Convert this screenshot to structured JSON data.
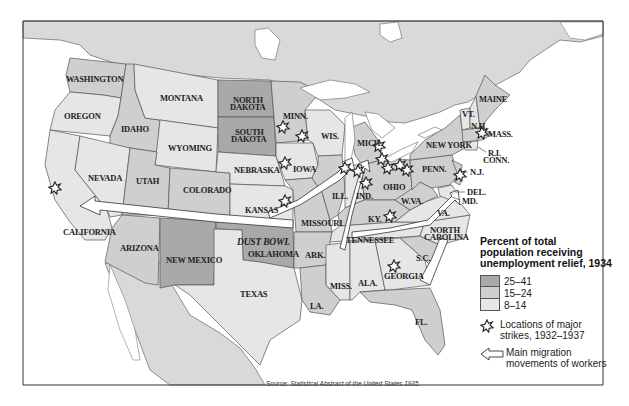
{
  "map": {
    "title": "Percent of total population receiving unemployment relief, 1934",
    "colors": {
      "high": "#a9a9a9",
      "medium": "#cfcfcf",
      "low": "#e6e6e6",
      "canada_mexico": "#d9d9d9",
      "water": "#ffffff",
      "border": "#555555"
    },
    "states": [
      {
        "name": "WASHINGTON",
        "category": "15-24"
      },
      {
        "name": "OREGON",
        "category": "8-14"
      },
      {
        "name": "CALIFORNIA",
        "category": "8-14"
      },
      {
        "name": "IDAHO",
        "category": "15-24"
      },
      {
        "name": "NEVADA",
        "category": "8-14"
      },
      {
        "name": "MONTANA",
        "category": "8-14"
      },
      {
        "name": "WYOMING",
        "category": "8-14"
      },
      {
        "name": "UTAH",
        "category": "15-24"
      },
      {
        "name": "COLORADO",
        "category": "15-24"
      },
      {
        "name": "ARIZONA",
        "category": "15-24"
      },
      {
        "name": "NEW MEXICO",
        "category": "25-41"
      },
      {
        "name": "NORTH DAKOTA",
        "category": "25-41"
      },
      {
        "name": "SOUTH DAKOTA",
        "category": "25-41"
      },
      {
        "name": "NEBRASKA",
        "category": "8-14"
      },
      {
        "name": "KANSAS",
        "category": "8-14"
      },
      {
        "name": "OKLAHOMA",
        "category": "25-41"
      },
      {
        "name": "TEXAS",
        "category": "8-14"
      },
      {
        "name": "MINN.",
        "category": "15-24"
      },
      {
        "name": "IOWA",
        "category": "8-14"
      },
      {
        "name": "MISSOURI",
        "category": "15-24"
      },
      {
        "name": "ARK.",
        "category": "15-24"
      },
      {
        "name": "LA.",
        "category": "15-24"
      },
      {
        "name": "WIS.",
        "category": "8-14"
      },
      {
        "name": "ILL.",
        "category": "15-24"
      },
      {
        "name": "MICH.",
        "category": "15-24"
      },
      {
        "name": "IND.",
        "category": "8-14"
      },
      {
        "name": "OHIO",
        "category": "15-24"
      },
      {
        "name": "KY.",
        "category": "15-24"
      },
      {
        "name": "TENNESSEE",
        "category": "8-14"
      },
      {
        "name": "MISS.",
        "category": "8-14"
      },
      {
        "name": "ALA.",
        "category": "8-14"
      },
      {
        "name": "GEORGIA",
        "category": "8-14"
      },
      {
        "name": "FL.",
        "category": "15-24"
      },
      {
        "name": "S.C.",
        "category": "15-24"
      },
      {
        "name": "NORTH CAROLINA",
        "category": "8-14"
      },
      {
        "name": "VA.",
        "category": "8-14"
      },
      {
        "name": "W.VA.",
        "category": "15-24"
      },
      {
        "name": "PENN.",
        "category": "15-24"
      },
      {
        "name": "NEW YORK",
        "category": "15-24"
      },
      {
        "name": "N.J.",
        "category": "15-24"
      },
      {
        "name": "DEL.",
        "category": "8-14"
      },
      {
        "name": "MD.",
        "category": "8-14"
      },
      {
        "name": "VT.",
        "category": "8-14"
      },
      {
        "name": "N.H.",
        "category": "8-14"
      },
      {
        "name": "MAINE",
        "category": "15-24"
      },
      {
        "name": "MASS.",
        "category": "15-24"
      },
      {
        "name": "R.I.",
        "category": "15-24"
      },
      {
        "name": "CONN.",
        "category": "8-14"
      }
    ],
    "labels": {
      "washington": "WASHINGTON",
      "oregon": "OREGON",
      "california": "CALIFORNIA",
      "idaho": "IDAHO",
      "nevada": "NEVADA",
      "montana": "MONTANA",
      "wyoming": "WYOMING",
      "utah": "UTAH",
      "colorado": "COLORADO",
      "arizona": "ARIZONA",
      "new_mexico": "NEW MEXICO",
      "north_dakota_1": "NORTH",
      "north_dakota_2": "DAKOTA",
      "south_dakota_1": "SOUTH",
      "south_dakota_2": "DAKOTA",
      "nebraska": "NEBRASKA",
      "kansas": "KANSAS",
      "oklahoma": "OKLAHOMA",
      "dust_bowl": "DUST BOWL",
      "texas": "TEXAS",
      "minn": "MINN.",
      "iowa": "IOWA",
      "missouri": "MISSOURI",
      "ark": "ARK.",
      "la": "LA.",
      "wis": "WIS.",
      "ill": "ILL.",
      "mich": "MICH.",
      "ind": "IND.",
      "ohio": "OHIO",
      "ky": "KY.",
      "tennessee": "TENNESSEE",
      "miss": "MISS.",
      "ala": "ALA.",
      "georgia": "GEORGIA",
      "fl": "FL.",
      "sc": "S.C.",
      "nc_1": "NORTH",
      "nc_2": "CAROLINA",
      "va": "VA.",
      "wva": "W.VA.",
      "penn": "PENN.",
      "new_york": "NEW YORK",
      "nj": "N.J.",
      "del": "DEL.",
      "md": "MD.",
      "vt": "VT.",
      "nh": "N.H.",
      "maine": "MAINE",
      "mass": "MASS.",
      "ri": "R.I.",
      "conn": "CONN."
    },
    "strikes": [
      {
        "state": "CALIFORNIA",
        "x": 55,
        "y": 188
      },
      {
        "state": "MINN.",
        "x": 283,
        "y": 127
      },
      {
        "state": "MINN.",
        "x": 302,
        "y": 136
      },
      {
        "state": "IOWA",
        "x": 285,
        "y": 163
      },
      {
        "state": "KANSAS",
        "x": 285,
        "y": 201
      },
      {
        "state": "ILL.",
        "x": 345,
        "y": 168
      },
      {
        "state": "IND.",
        "x": 358,
        "y": 171
      },
      {
        "state": "IND.",
        "x": 366,
        "y": 183
      },
      {
        "state": "MICH.",
        "x": 379,
        "y": 146
      },
      {
        "state": "MICH.",
        "x": 382,
        "y": 159
      },
      {
        "state": "OHIO",
        "x": 388,
        "y": 168
      },
      {
        "state": "OHIO",
        "x": 400,
        "y": 165
      },
      {
        "state": "OHIO",
        "x": 407,
        "y": 170
      },
      {
        "state": "KY.",
        "x": 390,
        "y": 216
      },
      {
        "state": "GEORGIA",
        "x": 394,
        "y": 266
      },
      {
        "state": "MASS.",
        "x": 482,
        "y": 133
      },
      {
        "state": "N.J.",
        "x": 460,
        "y": 175
      }
    ]
  },
  "legend": {
    "title_line1": "Percent of total",
    "title_line2": "population receiving",
    "title_line3": "unemployment relief, 1934",
    "categories": [
      {
        "label": "25–41",
        "color": "#a9a9a9"
      },
      {
        "label": "15–24",
        "color": "#cfcfcf"
      },
      {
        "label": "8–14",
        "color": "#e6e6e6"
      }
    ],
    "strikes_line1": "Locations of major",
    "strikes_line2": "strikes, 1932–1937",
    "migration_line1": "Main migration",
    "migration_line2": "movements of workers"
  },
  "source": {
    "prefix": "Source: ",
    "title": "Statistical Abstract of the United States 1935"
  }
}
